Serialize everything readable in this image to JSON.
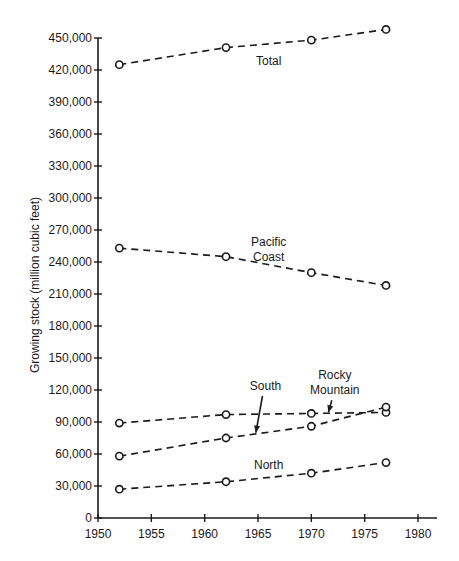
{
  "chart_data": {
    "type": "line",
    "title": "",
    "xlabel": "",
    "ylabel": "Growing stock (million cubic feet)",
    "xlim": [
      1950,
      1980
    ],
    "ylim": [
      0,
      450000
    ],
    "x_ticks": [
      1950,
      1955,
      1960,
      1965,
      1970,
      1975,
      1980
    ],
    "y_ticks": [
      0,
      30000,
      60000,
      90000,
      120000,
      150000,
      180000,
      210000,
      240000,
      270000,
      300000,
      330000,
      360000,
      390000,
      420000,
      450000
    ],
    "y_tick_labels": [
      "0",
      "30,000",
      "60,000",
      "90,000",
      "120,000",
      "150,000",
      "180,000",
      "210,000",
      "240,000",
      "270,000",
      "300,000",
      "330,000",
      "360,000",
      "390,000",
      "420,000",
      "450,000"
    ],
    "grid": false,
    "legend": "none (inline series labels)",
    "line_style": "dashed with open circle markers",
    "x": [
      1952,
      1962,
      1970,
      1977
    ],
    "series": [
      {
        "name": "Total",
        "values": [
          425000,
          441000,
          448000,
          458000
        ]
      },
      {
        "name": "Pacific Coast",
        "values": [
          253000,
          245000,
          230000,
          218000
        ]
      },
      {
        "name": "Rocky Mountain",
        "values": [
          89000,
          97000,
          98000,
          99000
        ]
      },
      {
        "name": "South",
        "values": [
          58000,
          75000,
          86000,
          104000
        ]
      },
      {
        "name": "North",
        "values": [
          27000,
          34000,
          42000,
          52000
        ]
      }
    ],
    "annotations": [
      {
        "text": "Total",
        "lines": [
          "Total"
        ],
        "x": 1966,
        "y": 425000
      },
      {
        "text": "Pacific Coast",
        "lines": [
          "Pacific",
          "Coast"
        ],
        "x": 1966,
        "y": 255000
      },
      {
        "text": "South",
        "lines": [
          "South"
        ],
        "x": 1965.7,
        "y": 120000,
        "arrow_to": [
          1964.8,
          80000
        ]
      },
      {
        "text": "Rocky Mountain",
        "lines": [
          "Rocky",
          "Mountain"
        ],
        "x": 1972.2,
        "y": 130000,
        "arrow_to": [
          1971.6,
          99000
        ]
      },
      {
        "text": "North",
        "lines": [
          "North"
        ],
        "x": 1966,
        "y": 46000
      }
    ]
  }
}
